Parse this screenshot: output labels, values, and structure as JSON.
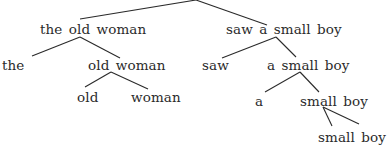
{
  "diagram": {
    "type": "constituency-tree",
    "root": {
      "label": "",
      "children": [
        "the old woman",
        "saw a small boy"
      ]
    },
    "nodes": {
      "n1": {
        "label": "the old woman",
        "x": 40,
        "y": 22
      },
      "n1a": {
        "label": "the",
        "x": 2,
        "y": 58
      },
      "n1b": {
        "label": "old woman",
        "x": 88,
        "y": 58
      },
      "n1b1": {
        "label": "old",
        "x": 77,
        "y": 90
      },
      "n1b2": {
        "label": "woman",
        "x": 131,
        "y": 90
      },
      "n2": {
        "label": "saw a small boy",
        "x": 226,
        "y": 22
      },
      "n2a": {
        "label": "saw",
        "x": 202,
        "y": 58
      },
      "n2b": {
        "label": "a small boy",
        "x": 267,
        "y": 58
      },
      "n2b1": {
        "label": "a",
        "x": 255,
        "y": 94
      },
      "n2b2": {
        "label": "small boy",
        "x": 300,
        "y": 94
      },
      "n2b2x": {
        "label": "small boy",
        "x": 318,
        "y": 130
      }
    },
    "edges": [
      {
        "from": "root",
        "to": "n1",
        "x1": 196,
        "y1": 0,
        "x2": 80,
        "y2": 19
      },
      {
        "from": "root",
        "to": "n2",
        "x1": 196,
        "y1": 0,
        "x2": 267,
        "y2": 25
      },
      {
        "from": "n1",
        "to": "n1a",
        "x1": 80,
        "y1": 37,
        "x2": 32,
        "y2": 56
      },
      {
        "from": "n1",
        "to": "n1b",
        "x1": 80,
        "y1": 37,
        "x2": 120,
        "y2": 58
      },
      {
        "from": "n1b",
        "to": "n1b1",
        "x1": 111,
        "y1": 72,
        "x2": 85,
        "y2": 87
      },
      {
        "from": "n1b",
        "to": "n1b2",
        "x1": 111,
        "y1": 72,
        "x2": 148,
        "y2": 89
      },
      {
        "from": "n2",
        "to": "n2a",
        "x1": 276,
        "y1": 37,
        "x2": 222,
        "y2": 58
      },
      {
        "from": "n2",
        "to": "n2b",
        "x1": 276,
        "y1": 37,
        "x2": 296,
        "y2": 57
      },
      {
        "from": "n2b",
        "to": "n2b1",
        "x1": 300,
        "y1": 72,
        "x2": 265,
        "y2": 92
      },
      {
        "from": "n2b",
        "to": "n2b2",
        "x1": 300,
        "y1": 72,
        "x2": 319,
        "y2": 92
      },
      {
        "from": "n2b2",
        "to": "n2b2x-small",
        "x1": 323,
        "y1": 107,
        "x2": 332,
        "y2": 126
      },
      {
        "from": "n2b2",
        "to": "n2b2x-boy",
        "x1": 323,
        "y1": 107,
        "x2": 359,
        "y2": 124
      }
    ]
  }
}
